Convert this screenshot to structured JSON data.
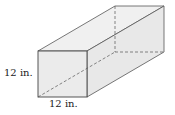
{
  "diagram": {
    "type": "rectangular-prism",
    "labels": {
      "height": "12 in.",
      "width": "12 in."
    },
    "colors": {
      "face": "#ebebeb",
      "edge": "#444444"
    }
  }
}
